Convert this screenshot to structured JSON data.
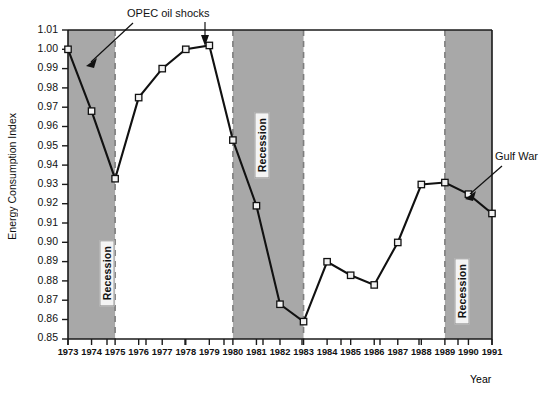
{
  "chart_data": {
    "type": "line",
    "title": "",
    "xlabel": "Year",
    "ylabel": "Energy Consumption Index",
    "xlim": [
      1973,
      1991
    ],
    "ylim": [
      0.85,
      1.01
    ],
    "ytick_step": 0.01,
    "grid": false,
    "legend": "none",
    "marker": "open-square",
    "categories": [
      1973,
      1974,
      1975,
      1976,
      1977,
      1978,
      1979,
      1980,
      1981,
      1982,
      1983,
      1984,
      1985,
      1986,
      1987,
      1988,
      1989,
      1990,
      1991
    ],
    "xtick_labels": [
      "1973",
      "1974",
      "1975",
      "1976",
      "1977",
      "1978",
      "1979",
      "1980",
      "1981",
      "1982",
      "1983",
      "1984",
      "1985",
      "1986",
      "1987",
      "1988",
      "1989",
      "1990",
      "1991"
    ],
    "ytick_labels": [
      "1.01",
      "1.00",
      "0.99",
      "0.98",
      "0.97",
      "0.96",
      "0.95",
      "0.94",
      "0.93",
      "0.92",
      "0.91",
      "0.90",
      "0.89",
      "0.88",
      "0.87",
      "0.86",
      "0.85"
    ],
    "ytick_values": [
      1.01,
      1.0,
      0.99,
      0.98,
      0.97,
      0.96,
      0.95,
      0.94,
      0.93,
      0.92,
      0.91,
      0.9,
      0.89,
      0.88,
      0.87,
      0.86,
      0.85
    ],
    "series": [
      {
        "name": "Energy Consumption Index",
        "values": [
          1.0,
          0.968,
          0.933,
          0.975,
          0.99,
          1.0,
          1.002,
          0.953,
          0.919,
          0.868,
          0.859,
          0.89,
          0.883,
          0.878,
          0.9,
          0.93,
          0.931,
          0.925,
          0.915
        ]
      }
    ],
    "shaded_bands": [
      {
        "label": "Recession",
        "start": 1973,
        "end": 1975
      },
      {
        "label": "Recession",
        "start": 1980,
        "end": 1983
      },
      {
        "label": "Recession",
        "start": 1989,
        "end": 1991
      }
    ],
    "annotations": [
      {
        "text": "OPEC oil shocks",
        "points_to": [
          1974,
          1979
        ]
      },
      {
        "text": "Gulf War",
        "points_to": [
          1990
        ]
      }
    ],
    "colors": {
      "band_fill": "#a8a8a8",
      "band_edge": "#7d7d7d",
      "line": "#111111",
      "marker_fill": "#f2f2f2",
      "axis": "#1a1a1a",
      "background": "#ffffff"
    }
  },
  "labels": {
    "y_axis_title": "Energy Consumption Index",
    "x_axis_title": "Year",
    "band_1": "Recession",
    "band_2": "Recession",
    "band_3": "Recession",
    "annotation_opec": "OPEC oil shocks",
    "annotation_gulf": "Gulf War"
  }
}
